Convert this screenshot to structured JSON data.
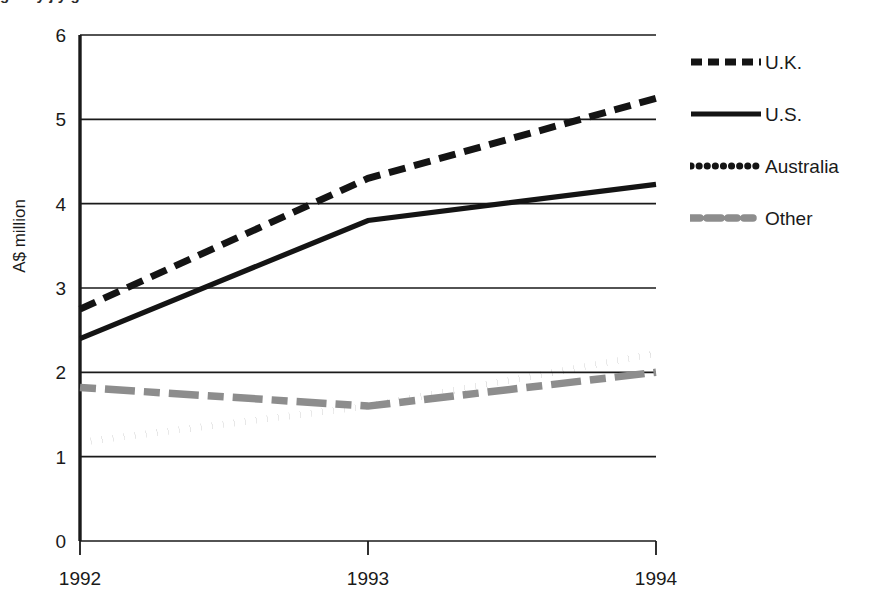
{
  "title": {
    "text_cropped": "g   d   t   y            j      y   g"
  },
  "axes": {
    "y_label": "A$ million",
    "y_ticks": [
      "0",
      "1",
      "2",
      "3",
      "4",
      "5",
      "6"
    ],
    "x_ticks": [
      "1992",
      "1993",
      "1994"
    ]
  },
  "legend": {
    "position": "right",
    "items": [
      {
        "label": "U.K.",
        "style": "dashed",
        "color": "#141414"
      },
      {
        "label": "U.S.",
        "style": "solid",
        "color": "#141414"
      },
      {
        "label": "Australia",
        "style": "dotted",
        "color": "#141414"
      },
      {
        "label": "Other",
        "style": "dashdot",
        "color": "#8d8d8d"
      }
    ]
  },
  "colors": {
    "axis": "#1a1a1a",
    "uk": "#141414",
    "us": "#141414",
    "australia": "#141414",
    "other": "#8d8d8d",
    "background": "#ffffff"
  },
  "chart_data": {
    "type": "line",
    "title": "",
    "xlabel": "",
    "ylabel": "A$ million",
    "x": [
      "1992",
      "1993",
      "1994"
    ],
    "categories": [
      "1992",
      "1993",
      "1994"
    ],
    "ylim": [
      0,
      6
    ],
    "yticks": [
      0,
      1,
      2,
      3,
      4,
      5,
      6
    ],
    "grid": true,
    "legend_position": "right",
    "series": [
      {
        "name": "U.K.",
        "values": [
          2.75,
          4.3,
          5.25
        ],
        "style": "dashed",
        "color": "#141414"
      },
      {
        "name": "U.S.",
        "values": [
          2.4,
          3.8,
          4.23
        ],
        "style": "solid",
        "color": "#141414"
      },
      {
        "name": "Australia",
        "values": [
          1.17,
          1.6,
          2.22
        ],
        "style": "dotted",
        "color": "#141414"
      },
      {
        "name": "Other",
        "values": [
          1.82,
          1.6,
          2.0
        ],
        "style": "dashdot",
        "color": "#8d8d8d"
      }
    ]
  }
}
